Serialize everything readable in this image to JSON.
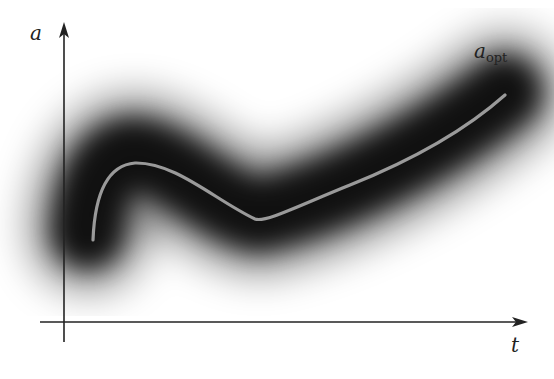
{
  "figure": {
    "y_axis_label": "a",
    "x_axis_label": "t",
    "curve_label_main": "a",
    "curve_label_sub": "opt"
  },
  "colors": {
    "background": "#ffffff",
    "axis": "#222222",
    "band": "#000000",
    "curve": "#9a9a9a"
  },
  "curve": {
    "name": "a_opt",
    "description": "optimal trajectory of a over time t, shown as light line inside dark uncertainty band"
  }
}
